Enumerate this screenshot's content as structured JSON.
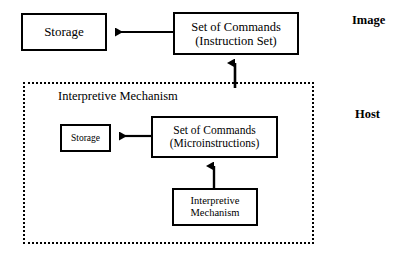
{
  "figure": {
    "nodes": {
      "image_storage": {
        "line1": "Storage"
      },
      "image_commands": {
        "line1": "Set of Commands",
        "line2": "(Instruction Set)"
      },
      "host_storage": {
        "line1": "Storage"
      },
      "host_commands": {
        "line1": "Set of Commands",
        "line2": "(Microinstructions)"
      },
      "host_interpretive": {
        "line1": "Interpretive",
        "line2": "Mechanism"
      }
    },
    "containers": {
      "host_region_label": "Interpretive Mechanism"
    },
    "captions": {
      "image": "Image",
      "host": "Host"
    },
    "colors": {
      "stroke": "#000000",
      "background": "#ffffff"
    }
  }
}
